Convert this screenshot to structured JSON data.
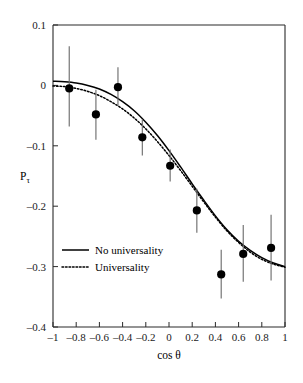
{
  "chart_data": {
    "type": "scatter",
    "title": "",
    "xlabel": "cos θ",
    "ylabel": "Pτ",
    "ylabel_base": "P",
    "ylabel_sub": "τ",
    "xlim": [
      -1,
      1
    ],
    "ylim": [
      -0.4,
      0.1
    ],
    "grid": false,
    "legend_position": "center-left",
    "xticks": [
      -1,
      -0.8,
      -0.6,
      -0.4,
      -0.2,
      0,
      0.2,
      0.4,
      0.6,
      0.8,
      1
    ],
    "xtick_labels": [
      "–1",
      "–0.8",
      "–0.6",
      "–0.4",
      "–0.2",
      "0",
      "0.2",
      "0.4",
      "0.6",
      "0.8",
      "1"
    ],
    "yticks": [
      0.1,
      0,
      -0.1,
      -0.2,
      -0.3,
      -0.4
    ],
    "ytick_labels": [
      "0.1",
      "0",
      "–0.1",
      "–0.2",
      "–0.3",
      "–0.4"
    ],
    "points": [
      {
        "x": -0.86,
        "y": -0.005,
        "yerr_low": 0.063,
        "yerr_high": 0.07
      },
      {
        "x": -0.63,
        "y": -0.048,
        "yerr_low": 0.042,
        "yerr_high": 0.041
      },
      {
        "x": -0.44,
        "y": -0.003,
        "yerr_low": 0.031,
        "yerr_high": 0.033
      },
      {
        "x": -0.23,
        "y": -0.086,
        "yerr_low": 0.03,
        "yerr_high": 0.03
      },
      {
        "x": 0.01,
        "y": -0.133,
        "yerr_low": 0.026,
        "yerr_high": 0.027
      },
      {
        "x": 0.24,
        "y": -0.207,
        "yerr_low": 0.037,
        "yerr_high": 0.036
      },
      {
        "x": 0.45,
        "y": -0.313,
        "yerr_low": 0.04,
        "yerr_high": 0.041
      },
      {
        "x": 0.64,
        "y": -0.279,
        "yerr_low": 0.046,
        "yerr_high": 0.048
      },
      {
        "x": 0.88,
        "y": -0.269,
        "yerr_low": 0.054,
        "yerr_high": 0.055
      }
    ],
    "series": [
      {
        "name": "No universality",
        "style": "solid",
        "x": [
          -1.0,
          -0.9,
          -0.8,
          -0.7,
          -0.6,
          -0.5,
          -0.4,
          -0.3,
          -0.2,
          -0.1,
          0.0,
          0.1,
          0.2,
          0.3,
          0.4,
          0.5,
          0.6,
          0.7,
          0.8,
          0.9,
          1.0
        ],
        "values": [
          0.007,
          0.006,
          0.004,
          0.0,
          -0.006,
          -0.015,
          -0.027,
          -0.042,
          -0.061,
          -0.083,
          -0.108,
          -0.135,
          -0.163,
          -0.19,
          -0.216,
          -0.239,
          -0.258,
          -0.273,
          -0.285,
          -0.294,
          -0.3
        ]
      },
      {
        "name": "Universality",
        "style": "dotted",
        "x": [
          -1.0,
          -0.9,
          -0.8,
          -0.7,
          -0.6,
          -0.5,
          -0.4,
          -0.3,
          -0.2,
          -0.1,
          0.0,
          0.1,
          0.2,
          0.3,
          0.4,
          0.5,
          0.6,
          0.7,
          0.8,
          0.9,
          1.0
        ],
        "values": [
          -0.001,
          -0.002,
          -0.005,
          -0.01,
          -0.017,
          -0.027,
          -0.039,
          -0.054,
          -0.072,
          -0.093,
          -0.116,
          -0.141,
          -0.167,
          -0.193,
          -0.218,
          -0.241,
          -0.26,
          -0.276,
          -0.288,
          -0.296,
          -0.301
        ]
      }
    ],
    "legend": [
      {
        "label": "No universality",
        "style": "solid"
      },
      {
        "label": "Universality",
        "style": "dotted"
      }
    ]
  }
}
